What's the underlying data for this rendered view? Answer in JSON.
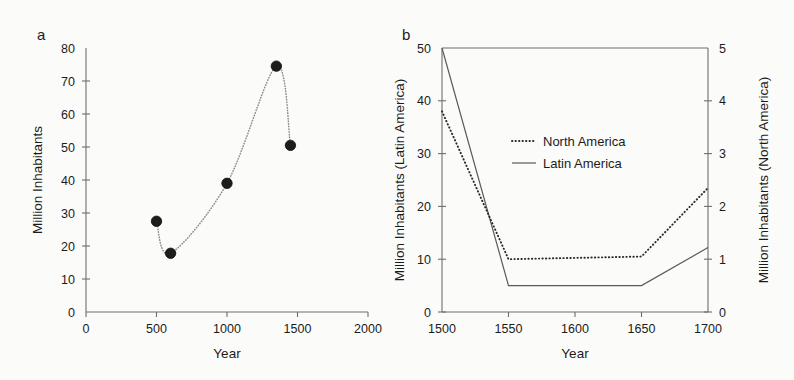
{
  "figure": {
    "background": "#fbfbfa",
    "ink_color": "#1b1b1b"
  },
  "panel_a": {
    "letter": "a",
    "xlabel": "Year",
    "ylabel": "Million Inhabitants",
    "xticks": [
      "0",
      "500",
      "1000",
      "1500",
      "2000"
    ],
    "yticks": [
      "0",
      "10",
      "20",
      "30",
      "40",
      "50",
      "60",
      "70",
      "80"
    ]
  },
  "panel_b": {
    "letter": "b",
    "xlabel": "Year",
    "ylabel_left": "Million Inhabitants (Latin America)",
    "ylabel_right": "Million Inhabitants (North America)",
    "xticks": [
      "1500",
      "1550",
      "1600",
      "1650",
      "1700"
    ],
    "yticks_left": [
      "0",
      "10",
      "20",
      "30",
      "40",
      "50"
    ],
    "yticks_right": [
      "0",
      "1",
      "2",
      "3",
      "4",
      "5"
    ],
    "legend": [
      {
        "label": "North America",
        "style": "dotted"
      },
      {
        "label": "Latin America",
        "style": "solid"
      }
    ]
  },
  "chart_data": [
    {
      "type": "scatter",
      "panel": "a",
      "title": "",
      "xlabel": "Year",
      "ylabel": "Million Inhabitants",
      "xlim": [
        0,
        2000
      ],
      "ylim": [
        0,
        80
      ],
      "xticks": [
        0,
        500,
        1000,
        1500,
        2000
      ],
      "yticks": [
        0,
        10,
        20,
        30,
        40,
        50,
        60,
        70,
        80
      ],
      "grid": false,
      "legend": "none",
      "marker": "filled-circle",
      "connector": "dotted-spline",
      "x": [
        500,
        600,
        1000,
        1350,
        1450
      ],
      "y": [
        27.5,
        17.8,
        39.0,
        74.5,
        50.5
      ],
      "points": [
        {
          "x": 500,
          "y": 27.5
        },
        {
          "x": 600,
          "y": 17.8
        },
        {
          "x": 1000,
          "y": 39.0
        },
        {
          "x": 1350,
          "y": 74.5
        },
        {
          "x": 1450,
          "y": 50.5
        }
      ]
    },
    {
      "type": "line",
      "panel": "b",
      "title": "",
      "xlabel": "Year",
      "ylabel": "Million Inhabitants (Latin America)",
      "ylabel_secondary": "Million Inhabitants (North America)",
      "xlim": [
        1500,
        1700
      ],
      "ylim": [
        0,
        50
      ],
      "ylim_secondary": [
        0,
        5
      ],
      "xticks": [
        1500,
        1550,
        1600,
        1650,
        1700
      ],
      "yticks": [
        0,
        10,
        20,
        30,
        40,
        50
      ],
      "yticks_secondary": [
        0,
        1,
        2,
        3,
        4,
        5
      ],
      "grid": false,
      "legend_position": "upper-center",
      "x": [
        1500,
        1550,
        1650,
        1700
      ],
      "series": [
        {
          "name": "North America",
          "axis": "right",
          "style": "dotted",
          "units": "Million Inhabitants",
          "values": [
            3.8,
            1.0,
            1.05,
            2.35
          ]
        },
        {
          "name": "Latin America",
          "axis": "left",
          "style": "solid",
          "units": "Million Inhabitants",
          "values": [
            50.0,
            5.0,
            5.0,
            12.2
          ]
        }
      ]
    }
  ]
}
